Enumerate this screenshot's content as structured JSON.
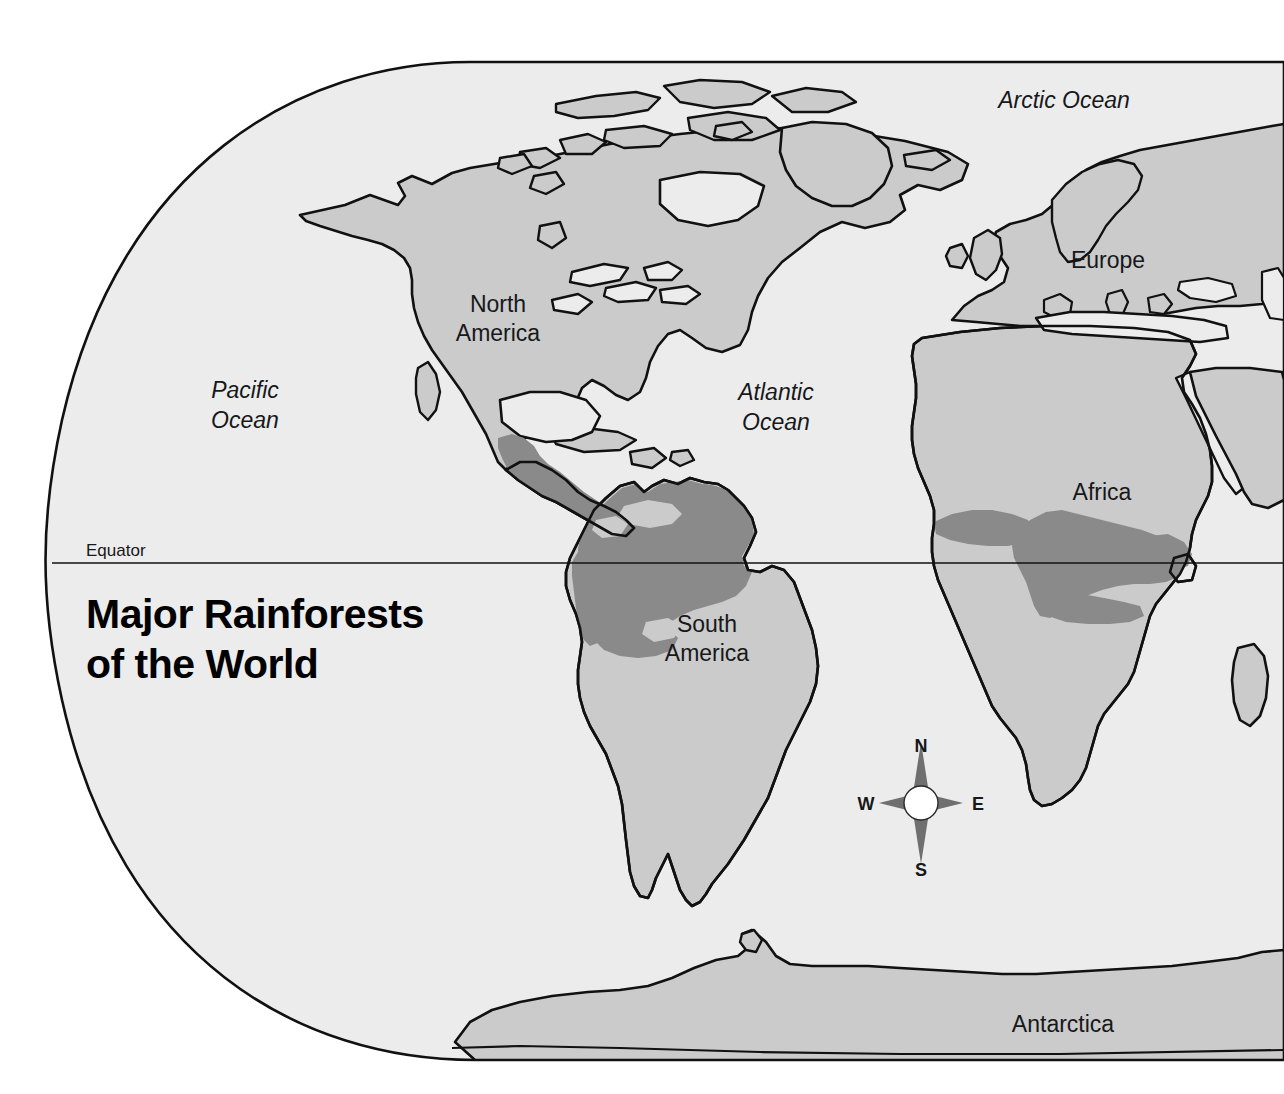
{
  "map": {
    "title_line1": "Major Rainforests",
    "title_line2": "of the World",
    "equator_label": "Equator",
    "colors": {
      "ocean": "#ececec",
      "land": "#cbcbcb",
      "rainforest": "#8a8a8a",
      "outline": "#111111",
      "page_background": "#ffffff",
      "text": "#17181a",
      "title": "#000000",
      "compass_star": "#6f6f6f",
      "compass_hub": "#ffffff"
    },
    "continents": [
      {
        "id": "north-america",
        "label": "North\nAmerica",
        "line1": "North",
        "line2": "America",
        "x": 498,
        "y": 312
      },
      {
        "id": "south-america",
        "label": "South\nAmerica",
        "line1": "South",
        "line2": "America",
        "x": 707,
        "y": 632
      },
      {
        "id": "europe",
        "label": "Europe",
        "line1": "Europe",
        "line2": "",
        "x": 1108,
        "y": 268
      },
      {
        "id": "africa",
        "label": "Africa",
        "line1": "Africa",
        "line2": "",
        "x": 1102,
        "y": 500
      },
      {
        "id": "antarctica",
        "label": "Antarctica",
        "line1": "Antarctica",
        "line2": "",
        "x": 1063,
        "y": 1032
      }
    ],
    "oceans": [
      {
        "id": "pacific-ocean",
        "line1": "Pacific",
        "line2": "Ocean",
        "x": 245,
        "y": 398
      },
      {
        "id": "atlantic-ocean",
        "line1": "Atlantic",
        "line2": "Ocean",
        "x": 776,
        "y": 400
      },
      {
        "id": "arctic-ocean",
        "line1": "Arctic Ocean",
        "line2": "",
        "x": 1064,
        "y": 108
      }
    ],
    "compass": {
      "north": "N",
      "east": "E",
      "south": "S",
      "west": "W",
      "center_x": 921,
      "center_y": 803
    },
    "legend_note": "Dark gray shading indicates major rainforest regions"
  }
}
